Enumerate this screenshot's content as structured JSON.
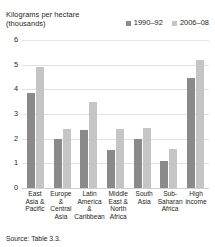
{
  "header": {
    "axis_title_line1": "Kilograms per hectare",
    "axis_title_line2": "(thousands)"
  },
  "source": {
    "text": "Source: Table 3.3."
  },
  "chart_data": {
    "type": "bar",
    "title": "Kilograms per hectare (thousands)",
    "xlabel": "",
    "ylabel": "Kilograms per hectare (thousands)",
    "ylim": [
      0,
      6
    ],
    "yticks": [
      0,
      1,
      2,
      3,
      4,
      5,
      6
    ],
    "ytick_labels": [
      "0",
      "1",
      "2",
      "3",
      "4",
      "5",
      "6"
    ],
    "grid": true,
    "legend_position": "top-right",
    "categories": [
      "East Asia & Pacific",
      "Europe & Central Asia",
      "Latin America & Caribbean",
      "Middle East & North Africa",
      "South Asia",
      "Sub-Saharan Africa",
      "High income"
    ],
    "category_label_lines": [
      [
        "East",
        "Asia &",
        "Pacific"
      ],
      [
        "Europe",
        "&",
        "Central",
        "Asia"
      ],
      [
        "Latin",
        "America",
        "&",
        "Caribbean"
      ],
      [
        "Middle",
        "East &",
        "North",
        "Africa"
      ],
      [
        "South",
        "Asia"
      ],
      [
        "Sub-",
        "Saharan",
        "Africa"
      ],
      [
        "High",
        "income"
      ]
    ],
    "series": [
      {
        "name": "1990–92",
        "color": "#8a8a8a",
        "values": [
          3.85,
          2.0,
          2.35,
          1.55,
          2.0,
          1.1,
          4.45
        ]
      },
      {
        "name": "2006–08",
        "color": "#c5c5c5",
        "values": [
          4.9,
          2.4,
          3.5,
          2.4,
          2.45,
          1.6,
          5.2
        ]
      }
    ]
  }
}
